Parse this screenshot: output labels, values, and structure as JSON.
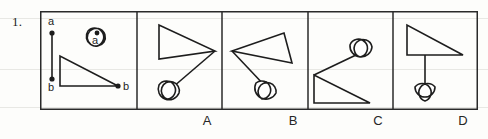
{
  "question": {
    "number": "1.",
    "type": "spatial-reasoning-multiple-choice"
  },
  "colors": {
    "ink": "#1d1d1d",
    "frame": "#2a2a2a",
    "paper": "#fdfdfb",
    "rule": "#e8e8e4"
  },
  "prompt_panel": {
    "name": "stimulus-panel",
    "segment": {
      "name": "line-segment-ab",
      "endpoint_top_label": "a",
      "endpoint_bottom_label": "b",
      "x": 12,
      "y_top": 22,
      "y_bottom": 68
    },
    "cloud": {
      "name": "cloud-shape-with-point-a",
      "point_label": "a",
      "cx": 57,
      "cy": 26
    },
    "triangle": {
      "name": "right-triangle-with-point-b",
      "point_label": "b",
      "vertices": "20,75 20,45 78,75"
    }
  },
  "options": [
    {
      "key": "A",
      "label": "A",
      "name": "option-a",
      "description": "triangle pointing right, line down-left to cloud",
      "triangle_vertices": "22,14 22,48 78,40",
      "connector": "78,40 36,76",
      "cloud_cx": 30,
      "cloud_cy": 78
    },
    {
      "key": "B",
      "label": "B",
      "name": "option-b",
      "description": "tilted triangle pointing left, line down-right to cloud",
      "triangle_vertices": "10,40 62,22 70,52",
      "connector": "10,40 44,76",
      "cloud_cx": 44,
      "cloud_cy": 80
    },
    {
      "key": "C",
      "label": "C",
      "name": "option-c",
      "description": "triangle at lower-left, line up-right to cloud",
      "triangle_vertices": "6,64 6,92 62,92",
      "connector": "6,64 46,42",
      "cloud_cx": 56,
      "cloud_cy": 34
    },
    {
      "key": "D",
      "label": "D",
      "name": "option-d",
      "description": "right triangle at top, vertical line down to cloud",
      "triangle_vertices": "14,14 14,44 70,44",
      "connector": "32,44 32,78",
      "cloud_cx": 32,
      "cloud_cy": 82
    }
  ],
  "layout": {
    "frame": {
      "x": 40,
      "y": 11,
      "width": 438,
      "height": 99
    },
    "dividers_x": [
      97,
      182,
      268,
      353
    ]
  }
}
